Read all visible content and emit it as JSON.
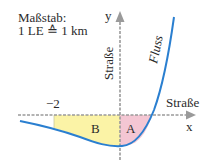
{
  "scale": {
    "title": "Maßstab:",
    "value": "1 LE ≙ 1 km"
  },
  "axes": {
    "x_label": "x",
    "y_label": "y",
    "x_road_label": "Straße",
    "y_road_label": "Straße",
    "tick_label_neg2": "−2"
  },
  "curve": {
    "label": "Fluss",
    "color": "#2a7fd0"
  },
  "regions": {
    "A": {
      "label": "A",
      "color": "#f4c6d3"
    },
    "B": {
      "label": "B",
      "color": "#fbf3a6"
    }
  },
  "colors": {
    "axis": "#9a9a9a"
  }
}
